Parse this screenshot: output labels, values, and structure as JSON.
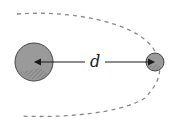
{
  "diagram": {
    "label_distance": "d",
    "colors": {
      "background": "#ffffff",
      "body_fill": "#9a9a9a",
      "body_stroke": "#444444",
      "arrow": "#1a1a1a",
      "orbit": "#888888"
    },
    "large_body": {
      "cx": 34,
      "cy": 62,
      "r": 19
    },
    "small_body": {
      "cx": 155,
      "cy": 62,
      "r": 9
    },
    "orbit_style": "dashed"
  }
}
